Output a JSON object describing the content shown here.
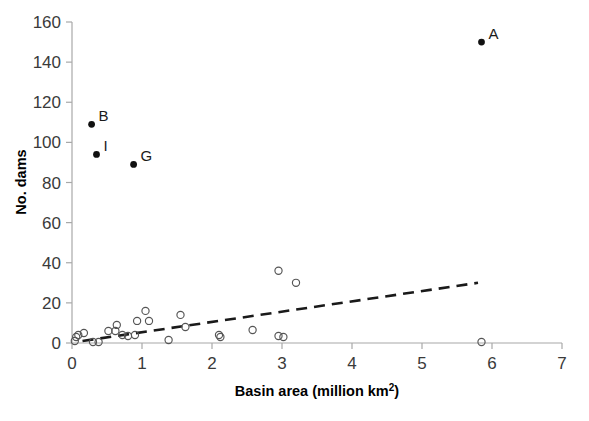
{
  "chart_data": {
    "type": "scatter",
    "title": "",
    "xlabel": "Basin area (million km²)",
    "ylabel": "No. dams",
    "xlim": [
      0,
      7
    ],
    "ylim": [
      0,
      160
    ],
    "xticks": [
      0,
      1,
      2,
      3,
      4,
      5,
      6,
      7
    ],
    "xticklabels": [
      "0",
      "1",
      "2",
      "3",
      "4",
      "5",
      "6",
      "7"
    ],
    "yticks": [
      0,
      20,
      40,
      60,
      80,
      100,
      120,
      140,
      160
    ],
    "yticklabels": [
      "0",
      "20",
      "40",
      "60",
      "80",
      "100",
      "120",
      "140",
      "160"
    ],
    "grid": false,
    "legend": "none",
    "series": [
      {
        "name": "Labelled basins",
        "marker": "filled-circle",
        "color": "#111111",
        "points": [
          {
            "label": "A",
            "x": 5.85,
            "y": 150
          },
          {
            "label": "B",
            "x": 0.28,
            "y": 109
          },
          {
            "label": "I",
            "x": 0.35,
            "y": 94
          },
          {
            "label": "G",
            "x": 0.88,
            "y": 89
          }
        ]
      },
      {
        "name": "Other basins",
        "marker": "open-circle",
        "color": "#555555",
        "points": [
          {
            "x": 0.04,
            "y": 1
          },
          {
            "x": 0.06,
            "y": 3
          },
          {
            "x": 0.09,
            "y": 4
          },
          {
            "x": 0.17,
            "y": 5
          },
          {
            "x": 0.3,
            "y": 0.5
          },
          {
            "x": 0.38,
            "y": 0.5
          },
          {
            "x": 0.52,
            "y": 6
          },
          {
            "x": 0.62,
            "y": 6
          },
          {
            "x": 0.64,
            "y": 9
          },
          {
            "x": 0.72,
            "y": 4
          },
          {
            "x": 0.8,
            "y": 3.5
          },
          {
            "x": 0.9,
            "y": 4
          },
          {
            "x": 0.93,
            "y": 11
          },
          {
            "x": 1.05,
            "y": 16
          },
          {
            "x": 1.1,
            "y": 11
          },
          {
            "x": 1.38,
            "y": 1.5
          },
          {
            "x": 1.55,
            "y": 14
          },
          {
            "x": 1.62,
            "y": 8
          },
          {
            "x": 2.1,
            "y": 4
          },
          {
            "x": 2.12,
            "y": 3
          },
          {
            "x": 2.58,
            "y": 6.5
          },
          {
            "x": 2.95,
            "y": 36
          },
          {
            "x": 2.95,
            "y": 3.5
          },
          {
            "x": 3.02,
            "y": 3
          },
          {
            "x": 3.2,
            "y": 30
          },
          {
            "x": 5.85,
            "y": 0.5
          }
        ]
      }
    ],
    "trendline": {
      "name": "Linear trend",
      "style": "dashed",
      "color": "#1a1a1a",
      "x_start": 0.15,
      "y_start": 1,
      "x_end": 5.8,
      "y_end": 30
    }
  },
  "axes": {
    "x_title_main": "Basin area (million km",
    "x_title_sup": "2",
    "x_title_tail": ")",
    "y_title": "No. dams"
  }
}
